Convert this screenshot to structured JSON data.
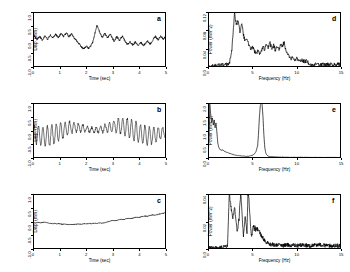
{
  "figure": {
    "layout": "2 columns x 3 rows",
    "panels": [
      "a",
      "b",
      "c",
      "d",
      "e",
      "f"
    ]
  },
  "chart_data": [
    {
      "id": "a",
      "type": "line",
      "title": "",
      "label": "a",
      "xlabel": "Time (sec)",
      "ylabel": "Disp. (mm)",
      "xlim": [
        0,
        5
      ],
      "ylim": [
        -1.0,
        1.0
      ],
      "xticks": [
        0,
        1,
        2,
        3,
        4,
        5
      ],
      "xticklabels": [
        "0",
        "1",
        "2",
        "3",
        "4",
        "5"
      ],
      "yticks": [
        -1.0,
        -0.5,
        0.0,
        0.5,
        1.0
      ],
      "yticklabels": [
        "-1.0",
        "-0.5",
        "0.0",
        "0.5",
        "1.0"
      ],
      "grid": false,
      "legend": "none",
      "x": [
        0.0,
        0.05,
        0.1,
        0.15,
        0.2,
        0.25,
        0.3,
        0.35,
        0.4,
        0.45,
        0.5,
        0.55,
        0.6,
        0.65,
        0.7,
        0.75,
        0.8,
        0.85,
        0.9,
        0.95,
        1.0,
        1.05,
        1.1,
        1.15,
        1.2,
        1.25,
        1.3,
        1.35,
        1.4,
        1.45,
        1.5,
        1.55,
        1.6,
        1.65,
        1.7,
        1.75,
        1.8,
        1.85,
        1.9,
        1.95,
        2.0,
        2.05,
        2.1,
        2.15,
        2.2,
        2.25,
        2.3,
        2.35,
        2.4,
        2.45,
        2.5,
        2.55,
        2.6,
        2.65,
        2.7,
        2.75,
        2.8,
        2.85,
        2.9,
        2.95,
        3.0,
        3.05,
        3.1,
        3.15,
        3.2,
        3.25,
        3.3,
        3.35,
        3.4,
        3.45,
        3.5,
        3.55,
        3.6,
        3.65,
        3.7,
        3.75,
        3.8,
        3.85,
        3.9,
        3.95,
        4.0,
        4.05,
        4.1,
        4.15,
        4.2,
        4.25,
        4.3,
        4.35,
        4.4,
        4.45,
        4.5,
        4.55,
        4.6,
        4.65,
        4.7,
        4.75,
        4.8,
        4.85,
        4.9,
        4.95,
        5.0
      ],
      "values": [
        0.22,
        0.14,
        0.06,
        0.02,
        0.05,
        0.11,
        0.05,
        -0.02,
        0.04,
        0.12,
        0.07,
        0.01,
        0.08,
        0.16,
        0.1,
        0.05,
        0.12,
        0.19,
        0.13,
        0.07,
        0.14,
        0.21,
        0.16,
        0.1,
        0.17,
        0.24,
        0.18,
        0.11,
        0.15,
        0.21,
        0.14,
        0.05,
        0.0,
        -0.06,
        -0.12,
        -0.18,
        -0.24,
        -0.3,
        -0.34,
        -0.3,
        -0.24,
        -0.28,
        -0.33,
        -0.26,
        -0.18,
        -0.08,
        0.1,
        0.32,
        0.5,
        0.42,
        0.28,
        0.16,
        0.08,
        0.14,
        0.22,
        0.14,
        0.06,
        0.12,
        0.2,
        0.12,
        0.02,
        -0.06,
        0.02,
        0.1,
        0.04,
        -0.04,
        0.04,
        0.12,
        0.05,
        -0.04,
        -0.12,
        -0.18,
        -0.14,
        -0.08,
        -0.14,
        -0.2,
        -0.15,
        -0.09,
        -0.15,
        -0.21,
        -0.16,
        -0.1,
        -0.16,
        -0.22,
        -0.17,
        -0.11,
        -0.05,
        -0.11,
        -0.17,
        -0.1,
        -0.03,
        0.04,
        0.11,
        0.05,
        -0.01,
        0.06,
        0.13,
        0.07,
        0.01,
        0.08,
        0.04
      ]
    },
    {
      "id": "b",
      "type": "line",
      "title": "",
      "label": "b",
      "xlabel": "Time (sec)",
      "ylabel": "Disp. (mm)",
      "xlim": [
        0,
        5
      ],
      "ylim": [
        -1.0,
        1.0
      ],
      "xticks": [
        0,
        1,
        2,
        3,
        4,
        5
      ],
      "xticklabels": [
        "0",
        "1",
        "2",
        "3",
        "4",
        "5"
      ],
      "yticks": [
        -1.0,
        -0.5,
        0.0,
        0.5,
        1.0
      ],
      "yticklabels": [
        "-1.0",
        "-0.5",
        "0.0",
        "0.5",
        "1.0"
      ],
      "grid": false,
      "legend": "none",
      "description": "high-frequency oscillation about 6 Hz with slowly varying envelope and drifting mean",
      "carrier_frequency_hz": 6,
      "amplitude": 0.3
    },
    {
      "id": "c",
      "type": "line",
      "title": "",
      "label": "c",
      "xlabel": "Time (sec)",
      "ylabel": "Disp. (mm)",
      "xlim": [
        0,
        5
      ],
      "ylim": [
        -1.0,
        1.0
      ],
      "xticks": [
        0,
        1,
        2,
        3,
        4,
        5
      ],
      "xticklabels": [
        "0",
        "1",
        "2",
        "3",
        "4",
        "5"
      ],
      "yticks": [
        -1.0,
        -0.5,
        0.0,
        0.5,
        1.0
      ],
      "yticklabels": [
        "-1.0",
        "-0.5",
        "0.0",
        "0.5",
        "1.0"
      ],
      "grid": false,
      "legend": "none",
      "x": [
        0.0,
        0.1,
        0.2,
        0.3,
        0.4,
        0.5,
        0.6,
        0.7,
        0.8,
        0.9,
        1.0,
        1.1,
        1.2,
        1.3,
        1.4,
        1.5,
        1.6,
        1.7,
        1.8,
        1.9,
        2.0,
        2.1,
        2.2,
        2.3,
        2.4,
        2.5,
        2.6,
        2.7,
        2.8,
        2.9,
        3.0,
        3.1,
        3.2,
        3.3,
        3.4,
        3.5,
        3.6,
        3.7,
        3.8,
        3.9,
        4.0,
        4.1,
        4.2,
        4.3,
        4.4,
        4.5,
        4.6,
        4.7,
        4.8,
        4.9,
        5.0
      ],
      "values": [
        -0.04,
        -0.05,
        -0.03,
        -0.05,
        -0.02,
        -0.04,
        -0.06,
        -0.08,
        -0.07,
        -0.09,
        -0.08,
        -0.1,
        -0.09,
        -0.11,
        -0.1,
        -0.11,
        -0.1,
        -0.09,
        -0.1,
        -0.08,
        -0.09,
        -0.07,
        -0.08,
        -0.06,
        -0.07,
        -0.05,
        -0.06,
        -0.04,
        -0.02,
        0.02,
        0.04,
        0.03,
        0.06,
        0.08,
        0.07,
        0.1,
        0.12,
        0.11,
        0.14,
        0.16,
        0.15,
        0.18,
        0.2,
        0.19,
        0.22,
        0.24,
        0.23,
        0.26,
        0.28,
        0.3,
        0.32
      ]
    },
    {
      "id": "d",
      "type": "line",
      "title": "",
      "label": "d",
      "xlabel": "Frequency (Hz)",
      "ylabel": "Power (mm^2)",
      "xlim": [
        0,
        15
      ],
      "ylim": [
        0.0,
        0.12
      ],
      "xticks": [
        0,
        5,
        10,
        15
      ],
      "xticklabels": [
        "0",
        "5",
        "10",
        "15"
      ],
      "yticks": [
        0.0,
        0.04,
        0.08,
        0.12
      ],
      "yticklabels": [
        "0.0",
        "0.04",
        "0.08",
        "0.12"
      ],
      "grid": false,
      "legend": "none",
      "x": [
        0.0,
        0.3,
        0.6,
        0.9,
        1.2,
        1.5,
        1.8,
        2.1,
        2.4,
        2.7,
        3.0,
        3.2,
        3.4,
        3.6,
        3.8,
        4.0,
        4.2,
        4.4,
        4.6,
        4.8,
        5.0,
        5.2,
        5.4,
        5.6,
        5.8,
        6.0,
        6.2,
        6.4,
        6.6,
        6.8,
        7.0,
        7.2,
        7.4,
        7.6,
        7.8,
        8.0,
        8.2,
        8.4,
        8.6,
        8.8,
        9.0,
        9.2,
        9.4,
        9.6,
        9.8,
        10.0,
        10.4,
        10.8,
        11.2,
        11.6,
        12.0,
        12.5,
        13.0,
        13.5,
        14.0,
        14.5,
        15.0
      ],
      "values": [
        0.001,
        0.002,
        0.002,
        0.003,
        0.003,
        0.004,
        0.004,
        0.005,
        0.006,
        0.04,
        0.118,
        0.09,
        0.105,
        0.075,
        0.098,
        0.07,
        0.055,
        0.062,
        0.048,
        0.04,
        0.045,
        0.036,
        0.03,
        0.034,
        0.028,
        0.032,
        0.044,
        0.038,
        0.05,
        0.042,
        0.052,
        0.04,
        0.048,
        0.036,
        0.046,
        0.038,
        0.052,
        0.044,
        0.056,
        0.034,
        0.026,
        0.022,
        0.018,
        0.02,
        0.016,
        0.018,
        0.015,
        0.013,
        0.012,
        0.006,
        0.005,
        0.005,
        0.005,
        0.005,
        0.005,
        0.005,
        0.005
      ]
    },
    {
      "id": "e",
      "type": "line",
      "title": "",
      "label": "e",
      "xlabel": "Frequency (Hz)",
      "ylabel": "Power (mm^2)",
      "xlim": [
        0,
        15
      ],
      "ylim": [
        0.0,
        2.0
      ],
      "xticks": [
        0,
        5,
        10,
        15
      ],
      "xticklabels": [
        "0",
        "5",
        "10",
        "15"
      ],
      "yticks": [
        0.0,
        0.5,
        1.0,
        1.5,
        2.0
      ],
      "yticklabels": [
        "0.0",
        "0.5",
        "1.0",
        "1.5",
        "2.0"
      ],
      "grid": false,
      "legend": "none",
      "peak_frequency_hz": 6.1,
      "peak_power": 2.0,
      "x": [
        0.0,
        0.1,
        0.2,
        0.3,
        0.4,
        0.5,
        0.6,
        0.7,
        0.8,
        0.9,
        1.0,
        1.1,
        1.2,
        1.3,
        1.4,
        1.5,
        1.6,
        1.8,
        2.0,
        2.2,
        2.4,
        2.6,
        2.8,
        3.0,
        3.2,
        3.4,
        3.6,
        3.8,
        4.0,
        4.2,
        4.4,
        4.6,
        4.8,
        5.0,
        5.2,
        5.4,
        5.6,
        5.7,
        5.8,
        5.9,
        6.0,
        6.1,
        6.2,
        6.3,
        6.4,
        6.5,
        6.6,
        6.8,
        7.0,
        7.5,
        8.0,
        8.5,
        9.0,
        9.5,
        10.0,
        11.0,
        12.0,
        13.0,
        14.0,
        15.0
      ],
      "values": [
        0.02,
        0.6,
        1.95,
        1.6,
        1.3,
        1.45,
        1.2,
        1.38,
        1.1,
        1.28,
        0.95,
        0.55,
        0.4,
        0.34,
        0.3,
        0.28,
        0.3,
        0.26,
        0.22,
        0.2,
        0.17,
        0.15,
        0.13,
        0.11,
        0.1,
        0.09,
        0.08,
        0.07,
        0.07,
        0.06,
        0.06,
        0.07,
        0.08,
        0.1,
        0.14,
        0.22,
        0.45,
        0.9,
        1.5,
        1.9,
        2.0,
        1.95,
        1.5,
        0.85,
        0.4,
        0.2,
        0.12,
        0.07,
        0.05,
        0.04,
        0.035,
        0.03,
        0.03,
        0.028,
        0.026,
        0.024,
        0.022,
        0.02,
        0.02,
        0.02
      ]
    },
    {
      "id": "f",
      "type": "line",
      "title": "",
      "label": "f",
      "xlabel": "Frequency (Hz)",
      "ylabel": "Power (mm^2)",
      "xlim": [
        0,
        15
      ],
      "ylim": [
        0.0,
        0.04
      ],
      "xticks": [
        0,
        5,
        10,
        15
      ],
      "xticklabels": [
        "0",
        "5",
        "10",
        "15"
      ],
      "yticks": [
        0.0,
        0.02,
        0.04
      ],
      "yticklabels": [
        "0.0",
        "0.02",
        "0.04"
      ],
      "grid": false,
      "legend": "none",
      "x": [
        0.0,
        0.5,
        1.0,
        1.5,
        2.0,
        2.2,
        2.4,
        2.6,
        2.8,
        3.0,
        3.1,
        3.2,
        3.3,
        3.4,
        3.5,
        3.6,
        3.7,
        3.8,
        3.9,
        4.0,
        4.1,
        4.2,
        4.3,
        4.4,
        4.5,
        4.6,
        4.7,
        4.8,
        4.9,
        5.0,
        5.1,
        5.2,
        5.3,
        5.4,
        5.5,
        5.6,
        5.7,
        5.8,
        5.9,
        6.0,
        6.2,
        6.4,
        6.6,
        6.8,
        7.0,
        7.5,
        8.0,
        8.5,
        9.0,
        9.5,
        10.0,
        10.5,
        11.0,
        11.5,
        12.0,
        12.5,
        13.0,
        13.5,
        14.0,
        14.5,
        15.0
      ],
      "values": [
        0.0005,
        0.0008,
        0.001,
        0.0012,
        0.0015,
        0.002,
        0.04,
        0.03,
        0.022,
        0.03,
        0.024,
        0.018,
        0.012,
        0.016,
        0.022,
        0.034,
        0.04,
        0.03,
        0.018,
        0.01,
        0.016,
        0.024,
        0.018,
        0.012,
        0.04,
        0.038,
        0.028,
        0.016,
        0.01,
        0.012,
        0.018,
        0.014,
        0.016,
        0.013,
        0.015,
        0.014,
        0.012,
        0.013,
        0.011,
        0.01,
        0.008,
        0.006,
        0.005,
        0.004,
        0.0035,
        0.003,
        0.0028,
        0.0026,
        0.003,
        0.0026,
        0.0024,
        0.003,
        0.0026,
        0.0024,
        0.0028,
        0.0032,
        0.0026,
        0.0024,
        0.0022,
        0.0024,
        0.0022
      ]
    }
  ]
}
